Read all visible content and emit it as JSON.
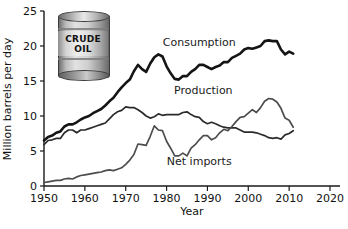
{
  "chart_data": {
    "type": "line",
    "title": "",
    "xlabel": "Year",
    "ylabel": "Million barrels per day",
    "xlim": [
      1950,
      2020
    ],
    "ylim": [
      0,
      25
    ],
    "xticks": [
      1950,
      1960,
      1970,
      1980,
      1990,
      2000,
      2010,
      2020
    ],
    "yticks": [
      0,
      5,
      10,
      15,
      20,
      25
    ],
    "grid": false,
    "legend": "inline-annotations",
    "annotations": [
      {
        "text": "Consumption",
        "x": 1988,
        "y": 20.0
      },
      {
        "text": "Production",
        "x": 1989,
        "y": 13.2
      },
      {
        "text": "Net imports",
        "x": 1988,
        "y": 3.0
      }
    ],
    "series": [
      {
        "name": "Consumption",
        "color": "#151515",
        "width": 2.6,
        "x": [
          1950,
          1951,
          1952,
          1953,
          1954,
          1955,
          1956,
          1957,
          1958,
          1959,
          1960,
          1961,
          1962,
          1963,
          1964,
          1965,
          1966,
          1967,
          1968,
          1969,
          1970,
          1971,
          1972,
          1973,
          1974,
          1975,
          1976,
          1977,
          1978,
          1979,
          1980,
          1981,
          1982,
          1983,
          1984,
          1985,
          1986,
          1987,
          1988,
          1989,
          1990,
          1991,
          1992,
          1993,
          1994,
          1995,
          1996,
          1997,
          1998,
          1999,
          2000,
          2001,
          2002,
          2003,
          2004,
          2005,
          2006,
          2007,
          2008,
          2009,
          2010,
          2011
        ],
        "y": [
          6.5,
          7.0,
          7.2,
          7.6,
          7.8,
          8.5,
          8.8,
          8.8,
          9.1,
          9.5,
          9.8,
          10.0,
          10.4,
          10.7,
          11.0,
          11.5,
          12.1,
          12.6,
          13.4,
          14.1,
          14.7,
          15.2,
          16.4,
          17.3,
          16.7,
          16.3,
          17.5,
          18.4,
          18.8,
          18.5,
          17.1,
          16.1,
          15.3,
          15.2,
          15.7,
          15.7,
          16.3,
          16.7,
          17.3,
          17.3,
          17.0,
          16.7,
          17.0,
          17.2,
          17.7,
          17.7,
          18.3,
          18.6,
          18.9,
          19.5,
          19.7,
          19.6,
          19.8,
          20.0,
          20.7,
          20.8,
          20.7,
          20.7,
          19.5,
          18.8,
          19.2,
          18.9
        ]
      },
      {
        "name": "Production",
        "color": "#2b2b2b",
        "width": 1.7,
        "x": [
          1950,
          1951,
          1952,
          1953,
          1954,
          1955,
          1956,
          1957,
          1958,
          1959,
          1960,
          1961,
          1962,
          1963,
          1964,
          1965,
          1966,
          1967,
          1968,
          1969,
          1970,
          1971,
          1972,
          1973,
          1974,
          1975,
          1976,
          1977,
          1978,
          1979,
          1980,
          1981,
          1982,
          1983,
          1984,
          1985,
          1986,
          1987,
          1988,
          1989,
          1990,
          1991,
          1992,
          1993,
          1994,
          1995,
          1996,
          1997,
          1998,
          1999,
          2000,
          2001,
          2002,
          2003,
          2004,
          2005,
          2006,
          2007,
          2008,
          2009,
          2010,
          2011
        ],
        "y": [
          5.9,
          6.5,
          6.6,
          6.8,
          6.8,
          7.6,
          8.0,
          8.0,
          7.6,
          8.0,
          8.0,
          8.2,
          8.4,
          8.6,
          8.8,
          9.0,
          9.6,
          10.2,
          10.6,
          10.8,
          11.3,
          11.2,
          11.2,
          10.9,
          10.5,
          10.0,
          9.7,
          9.9,
          10.3,
          10.1,
          10.2,
          10.2,
          10.2,
          10.2,
          10.5,
          10.6,
          10.2,
          9.9,
          9.8,
          9.2,
          8.9,
          9.1,
          8.9,
          8.6,
          8.4,
          8.3,
          8.3,
          8.3,
          8.0,
          7.7,
          7.7,
          7.7,
          7.6,
          7.4,
          7.2,
          6.9,
          6.8,
          6.9,
          6.7,
          7.3,
          7.5,
          7.9
        ]
      },
      {
        "name": "Net imports",
        "color": "#4d4d4d",
        "width": 1.7,
        "x": [
          1950,
          1951,
          1952,
          1953,
          1954,
          1955,
          1956,
          1957,
          1958,
          1959,
          1960,
          1961,
          1962,
          1963,
          1964,
          1965,
          1966,
          1967,
          1968,
          1969,
          1970,
          1971,
          1972,
          1973,
          1974,
          1975,
          1976,
          1977,
          1978,
          1979,
          1980,
          1981,
          1982,
          1983,
          1984,
          1985,
          1986,
          1987,
          1988,
          1989,
          1990,
          1991,
          1992,
          1993,
          1994,
          1995,
          1996,
          1997,
          1998,
          1999,
          2000,
          2001,
          2002,
          2003,
          2004,
          2005,
          2006,
          2007,
          2008,
          2009,
          2010,
          2011
        ],
        "y": [
          0.5,
          0.6,
          0.7,
          0.8,
          0.8,
          1.0,
          1.1,
          1.0,
          1.3,
          1.5,
          1.6,
          1.7,
          1.8,
          1.9,
          2.0,
          2.2,
          2.3,
          2.2,
          2.4,
          2.6,
          3.1,
          3.7,
          4.5,
          6.0,
          5.9,
          5.8,
          7.1,
          8.6,
          8.0,
          7.9,
          6.4,
          5.4,
          4.3,
          4.3,
          4.7,
          4.3,
          5.4,
          5.9,
          6.6,
          7.2,
          7.2,
          6.6,
          6.9,
          7.6,
          8.1,
          7.9,
          8.5,
          9.2,
          9.8,
          9.9,
          10.4,
          10.9,
          10.5,
          11.2,
          12.1,
          12.5,
          12.4,
          12.0,
          11.1,
          9.7,
          9.4,
          8.4
        ]
      }
    ]
  },
  "illustration": {
    "name": "crude-oil-barrel",
    "line1": "CRUDE",
    "line2": "OIL"
  }
}
